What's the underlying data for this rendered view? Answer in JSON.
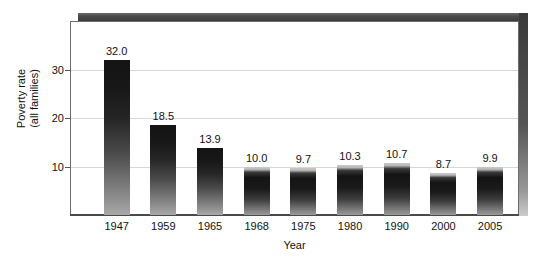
{
  "chart_data": {
    "type": "bar",
    "title": "",
    "subtitle": "",
    "xlabel": "Year",
    "ylabel": "Poverty rate\n(all families)",
    "ylabel_line1": "Poverty rate",
    "ylabel_line2": "(all families)",
    "categories": [
      "1947",
      "1959",
      "1965",
      "1968",
      "1975",
      "1980",
      "1990",
      "2000",
      "2005"
    ],
    "values": [
      32.0,
      18.5,
      13.9,
      10.0,
      9.7,
      10.3,
      10.7,
      8.7,
      9.9
    ],
    "value_labels": [
      "32.0",
      "18.5",
      "13.9",
      "10.0",
      "9.7",
      "10.3",
      "10.7",
      "8.7",
      "9.9"
    ],
    "ylim": [
      0,
      40
    ],
    "yticks": [
      10,
      20,
      30
    ],
    "ytick_labels": [
      "10",
      "20",
      "30"
    ],
    "grid": true,
    "grid_axis": "y",
    "legend": false,
    "legend_position": "none",
    "bar_color": "#1a1a1a",
    "grid_color": "#d8d8d8",
    "axis_color": "#4a4a4a",
    "frame_color": "#3a3a3a",
    "background": "#ffffff"
  }
}
